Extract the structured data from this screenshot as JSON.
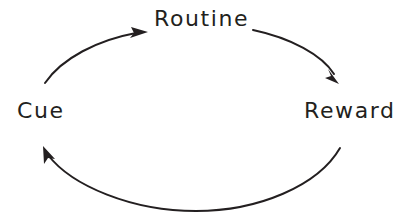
{
  "diagram": {
    "type": "habit-loop-cycle",
    "background_color": "#ffffff",
    "stroke_color": "#231f20",
    "text_color": "#231f20",
    "nodes": [
      {
        "id": "routine",
        "label": "Routine",
        "position": "top"
      },
      {
        "id": "cue",
        "label": "Cue",
        "position": "left"
      },
      {
        "id": "reward",
        "label": "Reward",
        "position": "right"
      }
    ],
    "arrows": [
      {
        "id": "cue-to-routine",
        "from": "Cue",
        "to": "Routine",
        "direction": "clockwise",
        "arrowhead": "at-routine"
      },
      {
        "id": "routine-to-reward",
        "from": "Routine",
        "to": "Reward",
        "direction": "clockwise",
        "arrowhead": "at-reward"
      },
      {
        "id": "reward-to-cue",
        "from": "Reward",
        "to": "Cue",
        "direction": "clockwise",
        "arrowhead": "at-cue"
      }
    ]
  }
}
